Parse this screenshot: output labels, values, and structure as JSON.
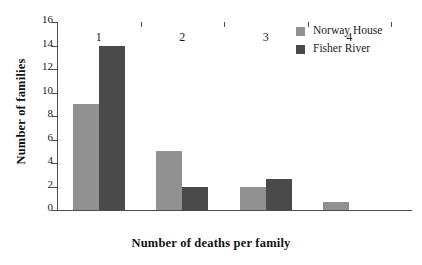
{
  "chart_data": {
    "type": "bar",
    "title": "",
    "xlabel": "Number of  deaths per family",
    "ylabel": "Number of families",
    "categories": [
      "1",
      "2",
      "3",
      "4"
    ],
    "series": [
      {
        "name": "Norway House",
        "color": "#919191",
        "values": [
          9,
          5,
          2,
          0.7
        ]
      },
      {
        "name": "Fisher River",
        "color": "#4a4a4a",
        "values": [
          14,
          2,
          2.6,
          0
        ]
      }
    ],
    "ylim": [
      0,
      16
    ],
    "ytick_step": 2,
    "ytick_labels": [
      "0",
      "2",
      "4",
      "6",
      "8",
      "10",
      "12",
      "14",
      "16"
    ],
    "grid": false,
    "legend_position": "top-right",
    "axis_color": "#4c4c4c"
  }
}
